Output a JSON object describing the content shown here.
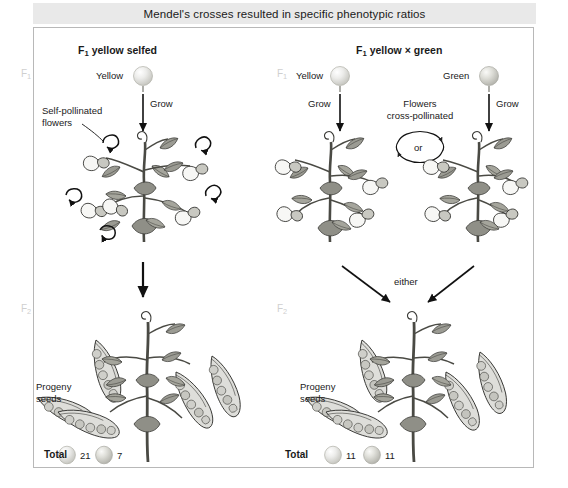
{
  "figure": {
    "title": "Mendel's crosses resulted in specific phenotypic ratios",
    "background_color": "#ffffff",
    "title_bar_color": "#e9e9e9",
    "border_color": "#b8b8b8",
    "ink_color": "#1a1a1a",
    "generation_label_color": "#cfcfcf"
  },
  "left_panel": {
    "heading_f": "F",
    "heading_sub": "1",
    "heading_rest": " yellow selfed",
    "generation_top_f": "F",
    "generation_top_sub": "1",
    "generation_bottom_f": "F",
    "generation_bottom_sub": "2",
    "parent_seed_label": "Yellow",
    "parent_seed_color": "#e8e8e4",
    "grow_label": "Grow",
    "pollination_label_line1": "Self-pollinated",
    "pollination_label_line2": "flowers",
    "progeny_label_line1": "Progeny",
    "progeny_label_line2": "seeds",
    "total_label": "Total",
    "totals": [
      {
        "seed_color": "#e8e8e4",
        "count": "21",
        "phenotype": "yellow"
      },
      {
        "seed_color": "#d8d8d2",
        "count": "7",
        "phenotype": "green"
      }
    ]
  },
  "right_panel": {
    "heading_f": "F",
    "heading_sub": "1",
    "heading_rest": " yellow ",
    "heading_cross": "×",
    "heading_rest2": " green",
    "generation_top_f": "F",
    "generation_top_sub": "1",
    "generation_bottom_f": "F",
    "generation_bottom_sub": "2",
    "parent_left_seed_label": "Yellow",
    "parent_left_seed_color": "#e8e8e4",
    "parent_right_seed_label": "Green",
    "parent_right_seed_color": "#dcdcd6",
    "grow_label_left": "Grow",
    "grow_label_right": "Grow",
    "cross_label_line1": "Flowers",
    "cross_label_line2": "cross-pollinated",
    "or_label": "or",
    "either_label": "either",
    "progeny_label_line1": "Progeny",
    "progeny_label_line2": "seeds",
    "total_label": "Total",
    "totals": [
      {
        "seed_color": "#e8e8e4",
        "count": "11",
        "phenotype": "yellow"
      },
      {
        "seed_color": "#d8d8d2",
        "count": "11",
        "phenotype": "green"
      }
    ]
  }
}
